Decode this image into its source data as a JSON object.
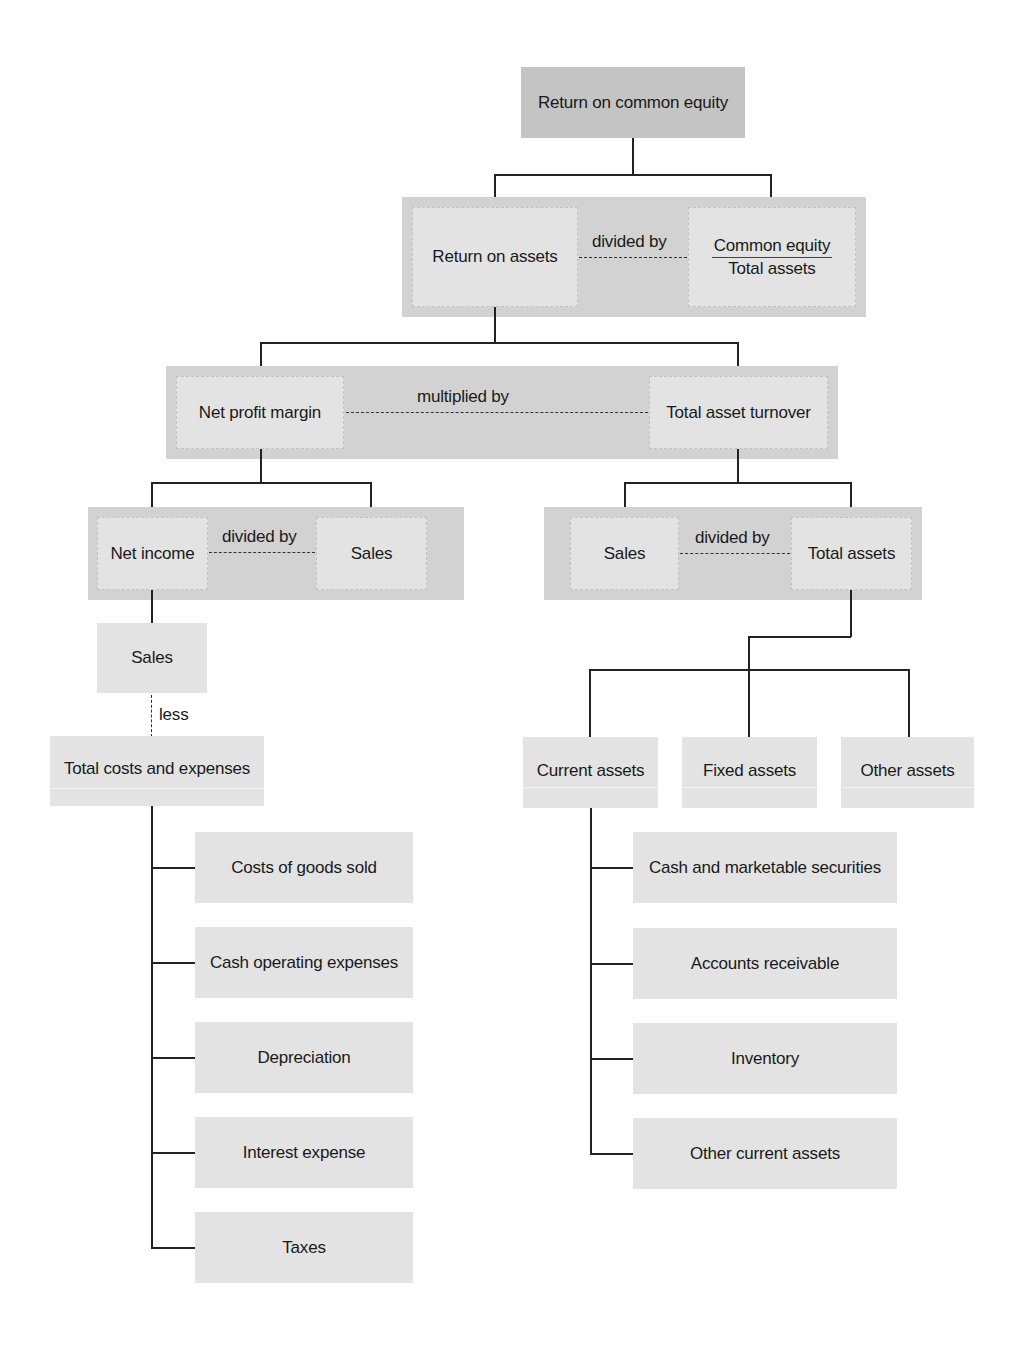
{
  "diagram": {
    "root": {
      "label": "Return on common equity"
    },
    "level1": {
      "left": {
        "label": "Return on assets"
      },
      "operator": "divided by",
      "right": {
        "numerator": "Common equity",
        "denominator": "Total assets"
      }
    },
    "level2": {
      "left": {
        "label": "Net profit margin"
      },
      "operator": "multiplied by",
      "right": {
        "label": "Total asset turnover"
      }
    },
    "margin_branch": {
      "left": {
        "label": "Net income"
      },
      "operator": "divided by",
      "right": {
        "label": "Sales"
      },
      "sales": {
        "label": "Sales"
      },
      "less_operator": "less",
      "total_costs": {
        "label": "Total costs and expenses"
      },
      "cost_items": [
        {
          "label": "Costs of goods sold"
        },
        {
          "label": "Cash operating expenses"
        },
        {
          "label": "Depreciation"
        },
        {
          "label": "Interest expense"
        },
        {
          "label": "Taxes"
        }
      ]
    },
    "turnover_branch": {
      "left": {
        "label": "Sales"
      },
      "operator": "divided by",
      "right": {
        "label": "Total assets"
      },
      "asset_categories": [
        {
          "label": "Current assets"
        },
        {
          "label": "Fixed assets"
        },
        {
          "label": "Other assets"
        }
      ],
      "current_asset_items": [
        {
          "label": "Cash and marketable securities"
        },
        {
          "label": "Accounts receivable"
        },
        {
          "label": "Inventory"
        },
        {
          "label": "Other current assets"
        }
      ]
    }
  },
  "colors": {
    "root_fill": "#c4c4c4",
    "band_fill": "#d2d2d2",
    "box_fill": "#e3e3e3",
    "line": "#222222"
  }
}
